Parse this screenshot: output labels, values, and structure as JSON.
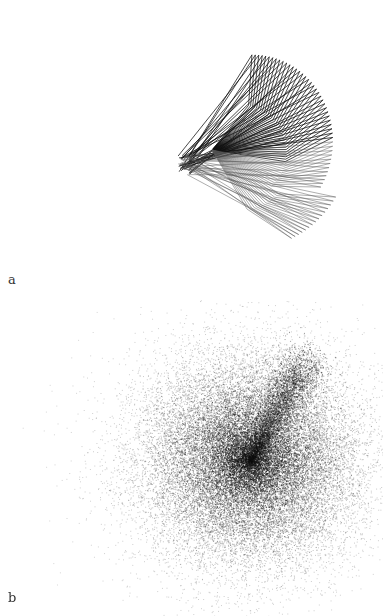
{
  "figure": {
    "panels": [
      {
        "label": "a",
        "description": "Fan of overlapping rotated line polygons forming a wing-like shape"
      },
      {
        "label": "b",
        "description": "Dense scatter point cloud with radial density falloff and a streak toward upper right"
      }
    ]
  },
  "colors": {
    "ink": "#111111",
    "light_ink": "#555555",
    "background": "#ffffff"
  }
}
